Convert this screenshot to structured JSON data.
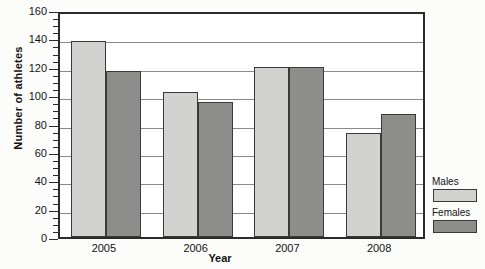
{
  "chart_data": {
    "type": "bar",
    "title": "",
    "xlabel": "Year",
    "ylabel": "Number of athletes",
    "categories": [
      "2005",
      "2006",
      "2007",
      "2008"
    ],
    "series": [
      {
        "name": "Males",
        "values": [
          138,
          102,
          120,
          73
        ],
        "color": "#d2d2d0"
      },
      {
        "name": "Females",
        "values": [
          117,
          95,
          120,
          87
        ],
        "color": "#8d8d8c"
      }
    ],
    "ylim": [
      0,
      160
    ],
    "ytick_labels": [
      "0",
      "20",
      "40",
      "60",
      "80",
      "100",
      "120",
      "140",
      "160"
    ],
    "ytick_values": [
      0,
      20,
      40,
      60,
      80,
      100,
      120,
      140,
      160
    ],
    "minor_tick_step": 5,
    "grid": true,
    "legend_position": "right"
  },
  "legend": {
    "males_label": "Males",
    "females_label": "Females"
  }
}
